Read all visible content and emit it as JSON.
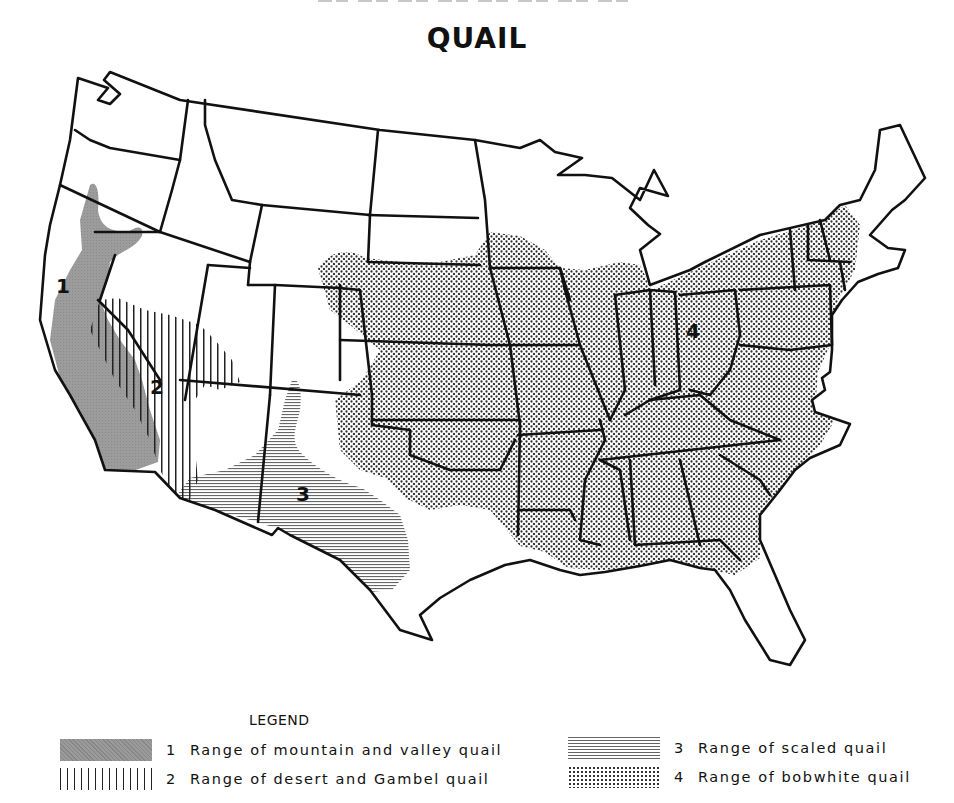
{
  "title": "QUAIL",
  "map": {
    "region_labels": [
      {
        "id": "1",
        "x": 62,
        "y": 288
      },
      {
        "id": "2",
        "x": 157,
        "y": 389
      },
      {
        "id": "3",
        "x": 303,
        "y": 497
      },
      {
        "id": "4",
        "x": 693,
        "y": 332
      }
    ],
    "colors": {
      "outline": "#111111",
      "mountain_valley_fill": "#9a9a9a",
      "desert_gambel_hatch": "#222222",
      "scaled_hatch": "#777777",
      "bobwhite_dots": "#333333",
      "background": "#ffffff"
    }
  },
  "legend": {
    "title": "LEGEND",
    "items": [
      {
        "number": "1",
        "label": "Range of mountain and valley quail",
        "pattern": "solid-gray"
      },
      {
        "number": "2",
        "label": "Range of desert and Gambel quail",
        "pattern": "vertical-lines"
      },
      {
        "number": "3",
        "label": "Range of scaled quail",
        "pattern": "horizontal-lines"
      },
      {
        "number": "4",
        "label": "Range of bobwhite quail",
        "pattern": "dots"
      }
    ]
  }
}
